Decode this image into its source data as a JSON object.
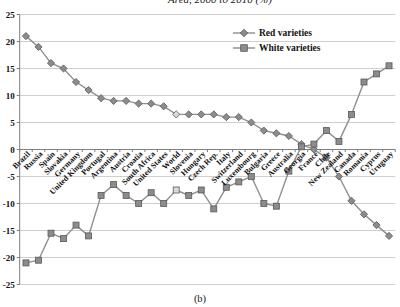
{
  "title": "Area,  2000 to 2010 (%)",
  "caption": "(b)",
  "legend": {
    "items": [
      {
        "label": "Red varieties",
        "marker": "diamond"
      },
      {
        "label": "White varieties",
        "marker": "square"
      }
    ]
  },
  "chart_data": {
    "type": "line",
    "title": "Area, 2000 to 2010 (%)",
    "categories": [
      "Brazil",
      "Russia",
      "Spain",
      "Slovakia",
      "Germany",
      "United Kingdom",
      "Portugal",
      "Argentina",
      "Austria",
      "Croatia",
      "South Africa",
      "United States",
      "World",
      "Slovenia",
      "Hungary",
      "Czech Rep.",
      "Italy",
      "Switzerland",
      "Luxembourg",
      "Bulgaria",
      "Greece",
      "Australia",
      "Georgia",
      "France",
      "Chile",
      "New Zealand",
      "Canada",
      "Romania",
      "Cyprus",
      "Uruguay"
    ],
    "series": [
      {
        "name": "Red varieties",
        "marker": "diamond",
        "values": [
          21,
          19,
          16,
          15,
          12.5,
          11,
          9.5,
          9,
          9,
          8.5,
          8.5,
          8,
          6.5,
          6.5,
          6.5,
          6.5,
          6,
          6,
          5,
          3.5,
          3,
          2.5,
          1,
          0,
          -1.5,
          -5,
          -9.5,
          -12,
          -14,
          -16
        ]
      },
      {
        "name": "White varieties",
        "marker": "square",
        "values": [
          -21,
          -20.5,
          -15.5,
          -16.5,
          -14,
          -16,
          -8.5,
          -6.5,
          -8.5,
          -10,
          -8,
          -10,
          -7.5,
          -8.5,
          -7.5,
          -11,
          -7,
          -6,
          -5,
          -10,
          -10.5,
          -4,
          0.5,
          1,
          3.5,
          1.5,
          6.5,
          12.5,
          14,
          15.5
        ]
      }
    ],
    "ylim": [
      -25,
      25
    ],
    "yticks": [
      25,
      20,
      15,
      10,
      5,
      0,
      -5,
      -10,
      -15,
      -20,
      -25
    ],
    "grid": true,
    "legend_position": "top-right",
    "highlight_category": "World",
    "colors": {
      "series_line": "#8f8f8f",
      "marker_fill": "#8c8c8c",
      "marker_stroke": "#595959",
      "highlight_fill": "#d9d9d9",
      "gridline": "#c3c3c3",
      "axis": "#7f7f7f",
      "text": "#111111"
    }
  }
}
